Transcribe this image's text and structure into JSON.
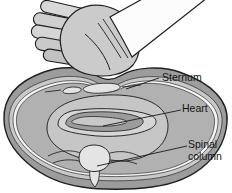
{
  "figure": {
    "labels": {
      "sternum": "Sternum",
      "heart": "Heart",
      "spinal_column": "Spinal column"
    },
    "palette": {
      "background": "#ffffff",
      "outline": "#1f1f1f",
      "body_outer": "#9c9c9c",
      "body_band": "#c9c9c9",
      "rib_band": "#f4f4f4",
      "cavity": "#b1b1b1",
      "pericardium": "#c6c6c6",
      "heart_wall": "#d6d6d6",
      "heart_muscle": "#9c9c9c",
      "heart_lumen": "#c8c8c8",
      "bone": "#e4e4e4",
      "hand": "#cbcbcb",
      "sleeve": "#fcfcfc",
      "label_text": "#141414"
    }
  }
}
